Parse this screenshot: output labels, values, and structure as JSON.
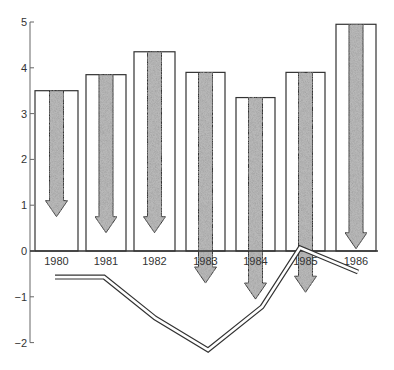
{
  "chart_data": {
    "type": "bar",
    "title": "",
    "xlabel": "",
    "ylabel": "",
    "ylim": [
      -2,
      5
    ],
    "yticks": [
      5,
      4,
      3,
      2,
      1,
      0,
      -1,
      -2
    ],
    "grid": false,
    "legend": null,
    "categories": [
      "1980",
      "1981",
      "1982",
      "1983",
      "1984",
      "1985",
      "1986"
    ],
    "series": [
      {
        "name": "bars (total height)",
        "type": "bar",
        "values": [
          3.5,
          3.85,
          4.35,
          3.9,
          3.35,
          3.9,
          4.95
        ]
      },
      {
        "name": "downward arrows (tip value)",
        "type": "arrow",
        "values": [
          0.75,
          0.4,
          0.4,
          -0.7,
          -1.05,
          -0.9,
          0.05
        ]
      },
      {
        "name": "double line",
        "type": "line",
        "values": [
          -0.57,
          -0.57,
          -1.46,
          -2.16,
          -1.22,
          0.07,
          -0.46
        ]
      }
    ]
  },
  "colors": {
    "outline": "#333333",
    "stipple_fill": "#b8b8b8",
    "background": "#ffffff"
  }
}
